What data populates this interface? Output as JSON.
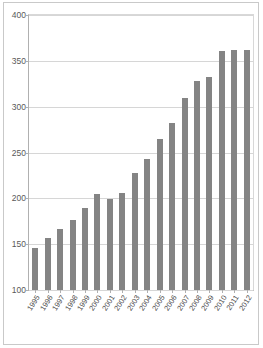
{
  "chart_data": {
    "type": "bar",
    "title": "",
    "xlabel": "",
    "ylabel": "",
    "ylim": [
      100,
      400
    ],
    "yticks": [
      100,
      150,
      200,
      250,
      300,
      350,
      400
    ],
    "grid": true,
    "legend": "none",
    "bar_color": "#848484",
    "categories": [
      "1995",
      "1996",
      "1997",
      "1998",
      "1999",
      "2000",
      "2001",
      "2002",
      "2003",
      "2004",
      "2005",
      "2006",
      "2007",
      "2008",
      "2009",
      "2010",
      "2011",
      "2012"
    ],
    "values": [
      146,
      157,
      167,
      176,
      190,
      205,
      199,
      206,
      228,
      243,
      265,
      282,
      310,
      328,
      332,
      361,
      362,
      362
    ],
    "series": [
      {
        "name": "Series 1",
        "values": [
          146,
          157,
          167,
          176,
          190,
          205,
          199,
          206,
          228,
          243,
          265,
          282,
          310,
          328,
          332,
          361,
          362,
          362
        ]
      }
    ]
  }
}
